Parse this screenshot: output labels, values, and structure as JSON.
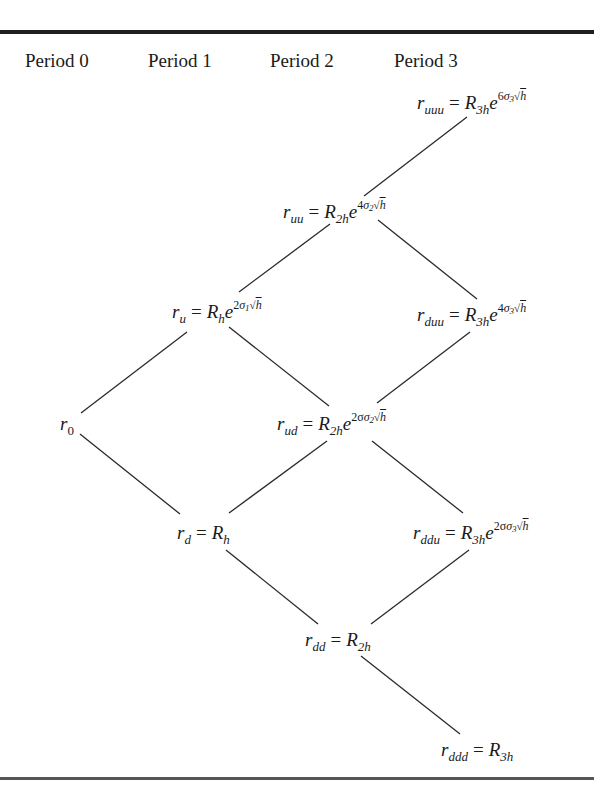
{
  "header": {
    "periods": [
      "Period 0",
      "Period 1",
      "Period 2",
      "Period 3"
    ]
  },
  "nodes": {
    "r0": {
      "lhs_base": "r",
      "lhs_sub": "0",
      "rhs_base": "",
      "rhs_sub": "",
      "exp_coef": "",
      "exp_sigma_sub": ""
    },
    "u": {
      "lhs_base": "r",
      "lhs_sub": "u",
      "eq": "=",
      "rhs_base": "R",
      "rhs_sub": "h",
      "exp_base": "e",
      "exp_coef": "2",
      "exp_sigma": "σ",
      "exp_sigma_sub": "1",
      "exp_root": "√",
      "exp_root_arg": "h"
    },
    "d": {
      "lhs_base": "r",
      "lhs_sub": "d",
      "eq": "=",
      "rhs_base": "R",
      "rhs_sub": "h"
    },
    "uu": {
      "lhs_base": "r",
      "lhs_sub": "uu",
      "eq": "=",
      "rhs_base": "R",
      "rhs_sub": "2h",
      "exp_base": "e",
      "exp_coef": "4",
      "exp_sigma": "σ",
      "exp_sigma_sub": "2",
      "exp_root": "√",
      "exp_root_arg": "h"
    },
    "ud": {
      "lhs_base": "r",
      "lhs_sub": "ud",
      "eq": "=",
      "rhs_base": "R",
      "rhs_sub": "2h",
      "exp_base": "e",
      "exp_coef": "2σ",
      "exp_sigma": "σ",
      "exp_sigma_sub": "2",
      "exp_root": "√",
      "exp_root_arg": "h"
    },
    "dd": {
      "lhs_base": "r",
      "lhs_sub": "dd",
      "eq": "=",
      "rhs_base": "R",
      "rhs_sub": "2h"
    },
    "uuu": {
      "lhs_base": "r",
      "lhs_sub": "uuu",
      "eq": "=",
      "rhs_base": "R",
      "rhs_sub": "3h",
      "exp_base": "e",
      "exp_coef": "6",
      "exp_sigma": "σ",
      "exp_sigma_sub": "3",
      "exp_root": "√",
      "exp_root_arg": "h"
    },
    "duu": {
      "lhs_base": "r",
      "lhs_sub": "duu",
      "eq": "=",
      "rhs_base": "R",
      "rhs_sub": "3h",
      "exp_base": "e",
      "exp_coef": "4",
      "exp_sigma": "σ",
      "exp_sigma_sub": "3",
      "exp_root": "√",
      "exp_root_arg": "h"
    },
    "ddu": {
      "lhs_base": "r",
      "lhs_sub": "ddu",
      "eq": "=",
      "rhs_base": "R",
      "rhs_sub": "3h",
      "exp_base": "e",
      "exp_coef": "2σ",
      "exp_sigma": "σ",
      "exp_sigma_sub": "3",
      "exp_root": "√",
      "exp_root_arg": "h"
    },
    "ddd": {
      "lhs_base": "r",
      "lhs_sub": "ddd",
      "eq": "=",
      "rhs_base": "R",
      "rhs_sub": "3h"
    }
  },
  "edges": [
    {
      "from": "r0",
      "to": "u"
    },
    {
      "from": "r0",
      "to": "d"
    },
    {
      "from": "u",
      "to": "uu"
    },
    {
      "from": "u",
      "to": "ud"
    },
    {
      "from": "d",
      "to": "ud"
    },
    {
      "from": "d",
      "to": "dd"
    },
    {
      "from": "uu",
      "to": "uuu"
    },
    {
      "from": "uu",
      "to": "duu"
    },
    {
      "from": "ud",
      "to": "duu"
    },
    {
      "from": "ud",
      "to": "ddu"
    },
    {
      "from": "dd",
      "to": "ddu"
    },
    {
      "from": "dd",
      "to": "ddd"
    }
  ]
}
